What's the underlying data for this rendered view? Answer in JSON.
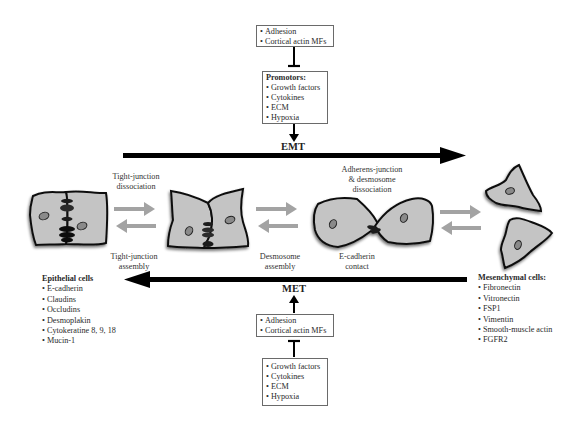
{
  "top": {
    "inhibitor_box": {
      "items": [
        "Adhesion",
        "Cortical actin MFs"
      ]
    },
    "promotors_box": {
      "title": "Promotors:",
      "items": [
        "Growth factors",
        "Cytokines",
        "ECM",
        "Hypoxia"
      ]
    },
    "process_label": "EMT"
  },
  "bottom": {
    "process_label": "MET",
    "adhesion_box": {
      "items": [
        "Adhesion",
        "Cortical actin MFs"
      ]
    },
    "factors_box": {
      "items": [
        "Growth factors",
        "Cytokines",
        "ECM",
        "Hypoxia"
      ]
    }
  },
  "transitions": [
    {
      "top_label": [
        "Tight-junction",
        "dissociation"
      ],
      "bottom_label": [
        "Tight-junction",
        "assembly"
      ]
    },
    {
      "top_label": [],
      "bottom_label": [
        "Desmosome",
        "assembly"
      ]
    },
    {
      "top_label": [
        "Adherens-junction",
        "& desmosome",
        "dissociation"
      ],
      "bottom_label": [
        "E-cadherin",
        "contact"
      ]
    }
  ],
  "epithelial": {
    "title": "Epithelial cells",
    "markers": [
      "E-cadherin",
      "Claudins",
      "Occludins",
      "Desmoplakin",
      "Cytokeratine 8, 9, 18",
      "Mucin-1"
    ]
  },
  "mesenchymal": {
    "title": "Mesenchymal cells:",
    "markers": [
      "Fibronectin",
      "Vitronectin",
      "FSP1",
      "Vimentin",
      "Smooth-muscle actin",
      "FGFR2"
    ]
  },
  "colors": {
    "cell_fill": "#c4c4c4",
    "cell_outline": "#111111",
    "nucleus_fill": "#8a8a8a",
    "junction": "#1e1e1e",
    "arrow_main": "#000000",
    "arrow_transition": "#a3a3a3"
  }
}
